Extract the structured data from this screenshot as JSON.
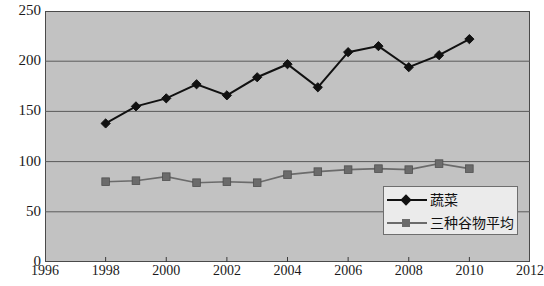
{
  "chart_data": {
    "type": "line",
    "title": "",
    "subtitle": "",
    "xlabel": "",
    "ylabel": "",
    "xlim": [
      1996,
      2012
    ],
    "ylim": [
      0,
      250
    ],
    "grid": true,
    "grid_axis": "y",
    "legend_position": "bottom-right",
    "plot_background": "#c2c2c2",
    "x_tick_labels": [
      "1996",
      "1998",
      "2000",
      "2002",
      "2004",
      "2006",
      "2008",
      "2010",
      "2012"
    ],
    "x_tick_values": [
      1996,
      1998,
      2000,
      2002,
      2004,
      2006,
      2008,
      2010,
      2012
    ],
    "y_tick_labels": [
      "0",
      "50",
      "100",
      "150",
      "200",
      "250"
    ],
    "y_tick_values": [
      0,
      50,
      100,
      150,
      200,
      250
    ],
    "x": [
      1998,
      1999,
      2000,
      2001,
      2002,
      2003,
      2004,
      2005,
      2006,
      2007,
      2008,
      2009,
      2010
    ],
    "series": [
      {
        "name": "蔬菜",
        "marker": "diamond",
        "color": "#111111",
        "values": [
          138,
          155,
          163,
          177,
          166,
          184,
          197,
          174,
          209,
          215,
          194,
          206,
          222
        ]
      },
      {
        "name": "三种谷物平均",
        "marker": "square",
        "color": "#6b6b6b",
        "values": [
          80,
          81,
          85,
          79,
          80,
          79,
          87,
          90,
          92,
          93,
          92,
          98,
          93
        ]
      }
    ],
    "legend": [
      {
        "label": "蔬菜",
        "marker": "diamond",
        "color": "#111111"
      },
      {
        "label": "三种谷物平均",
        "marker": "square",
        "color": "#6b6b6b"
      }
    ],
    "annotations": []
  }
}
